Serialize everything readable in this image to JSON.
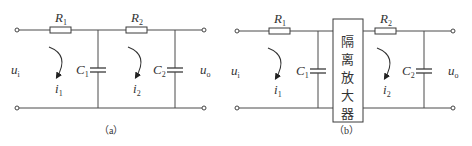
{
  "figure_a": {
    "caption": "（a）",
    "components": {
      "R1": {
        "letter": "R",
        "sub": "1"
      },
      "R2": {
        "letter": "R",
        "sub": "2"
      },
      "C1": {
        "letter": "C",
        "sub": "1"
      },
      "C2": {
        "letter": "C",
        "sub": "2"
      }
    },
    "currents": {
      "i1": {
        "letter": "i",
        "sub": "1"
      },
      "i2": {
        "letter": "i",
        "sub": "2"
      }
    },
    "input": {
      "letter": "u",
      "sub": "i"
    },
    "output": {
      "letter": "u",
      "sub": "o"
    }
  },
  "figure_b": {
    "caption": "（b）",
    "components": {
      "R1": {
        "letter": "R",
        "sub": "1"
      },
      "R2": {
        "letter": "R",
        "sub": "2"
      },
      "C1": {
        "letter": "C",
        "sub": "1"
      },
      "C2": {
        "letter": "C",
        "sub": "2"
      }
    },
    "currents": {
      "i1": {
        "letter": "i",
        "sub": "1"
      },
      "i2": {
        "letter": "i",
        "sub": "2"
      }
    },
    "input": {
      "letter": "u",
      "sub": "i"
    },
    "output": {
      "letter": "u",
      "sub": "o"
    },
    "amplifier": {
      "chars": [
        "隔",
        "离",
        "放",
        "大",
        "器"
      ]
    }
  }
}
